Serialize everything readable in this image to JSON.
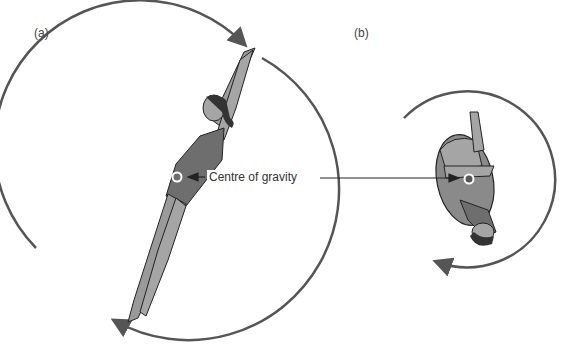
{
  "panels": [
    {
      "label": "(a)",
      "description": "Diver in extended (layout) position with large rotation circle"
    },
    {
      "label": "(b)",
      "description": "Diver in tucked position with small rotation circle"
    }
  ],
  "annotation": {
    "text": "Centre of gravity"
  },
  "colors": {
    "circle_stroke": "#555555",
    "body_fill": "#9a9a9a",
    "swimsuit_fill": "#6e6e6e",
    "outline": "#222222",
    "cog_marker": "#ffffff"
  }
}
